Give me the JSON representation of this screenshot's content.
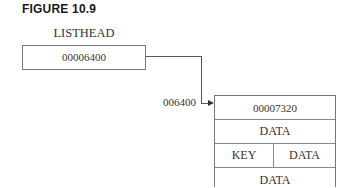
{
  "figure": {
    "label": "FIGURE 10.9"
  },
  "listhead": {
    "title": "LISTHEAD",
    "value": "00006400"
  },
  "pointer": {
    "address_label": "006400",
    "arrow_direction": "right"
  },
  "node": {
    "rows": [
      {
        "type": "single",
        "text": "00007320"
      },
      {
        "type": "single",
        "text": "DATA"
      },
      {
        "type": "split",
        "left": "KEY",
        "right": "DATA"
      },
      {
        "type": "single",
        "text": "DATA"
      }
    ]
  }
}
